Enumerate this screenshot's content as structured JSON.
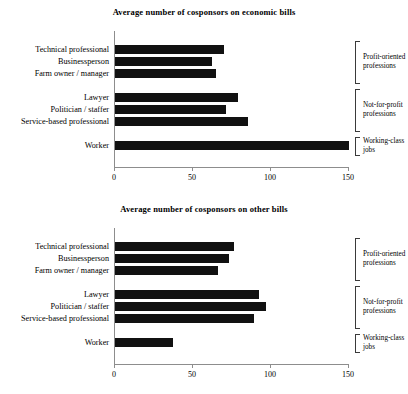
{
  "chart_data": [
    {
      "type": "bar",
      "orientation": "horizontal",
      "title": "Average number of cosponsors on economic bills",
      "xlabel": "",
      "ylabel": "",
      "xlim": [
        0,
        150
      ],
      "xticks": [
        "0",
        "50",
        "100",
        "150"
      ],
      "xtick_values": [
        0,
        50,
        100,
        150
      ],
      "grid": false,
      "legend": "none",
      "bar_color": "#111111",
      "categories": [
        "Technical professional",
        "Businessperson",
        "Farm owner / manager",
        "Lawyer",
        "Politician / staffer",
        "Service-based professional",
        "Worker"
      ],
      "values": [
        70,
        62,
        65,
        79,
        71,
        85,
        150
      ],
      "groups": [
        {
          "label_line1": "Profit-oriented",
          "label_line2": "professions",
          "members": [
            0,
            1,
            2
          ]
        },
        {
          "label_line1": "Not-for-profit",
          "label_line2": "professions",
          "members": [
            3,
            4,
            5
          ]
        },
        {
          "label_line1": "Working-class",
          "label_line2": "jobs",
          "members": [
            6
          ]
        }
      ]
    },
    {
      "type": "bar",
      "orientation": "horizontal",
      "title": "Average number of cosponsors on other bills",
      "xlabel": "",
      "ylabel": "",
      "xlim": [
        0,
        150
      ],
      "xticks": [
        "0",
        "50",
        "100",
        "150"
      ],
      "xtick_values": [
        0,
        50,
        100,
        150
      ],
      "grid": false,
      "legend": "none",
      "bar_color": "#111111",
      "categories": [
        "Technical professional",
        "Businessperson",
        "Farm owner / manager",
        "Lawyer",
        "Politician / staffer",
        "Service-based professional",
        "Worker"
      ],
      "values": [
        76,
        73,
        66,
        92,
        97,
        89,
        37
      ],
      "groups": [
        {
          "label_line1": "Profit-oriented",
          "label_line2": "professions",
          "members": [
            0,
            1,
            2
          ]
        },
        {
          "label_line1": "Not-for-profit",
          "label_line2": "professions",
          "members": [
            3,
            4,
            5
          ]
        },
        {
          "label_line1": "Working-class",
          "label_line2": "jobs",
          "members": [
            6
          ]
        }
      ]
    }
  ]
}
